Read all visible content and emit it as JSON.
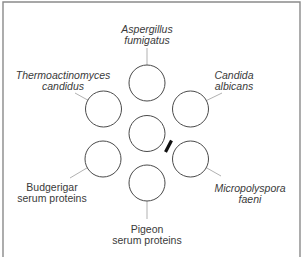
{
  "diagram": {
    "title": "",
    "type": "immunodiffusion well layout",
    "center_well": {
      "label": ""
    },
    "wells": [
      {
        "id": "top",
        "lines": [
          "Aspergillus",
          "fumigatus"
        ],
        "italic": true
      },
      {
        "id": "upper-left",
        "lines": [
          "Thermoactinomyces",
          "candidus"
        ],
        "italic": true
      },
      {
        "id": "upper-right",
        "lines": [
          "Candida",
          "albicans"
        ],
        "italic": true
      },
      {
        "id": "lower-left",
        "lines": [
          "Budgerigar",
          "serum proteins"
        ],
        "italic": false
      },
      {
        "id": "lower-right",
        "lines": [
          "Micropolyspora",
          "faeni"
        ],
        "italic": true
      },
      {
        "id": "bottom",
        "lines": [
          "Pigeon",
          "serum proteins"
        ],
        "italic": false
      }
    ],
    "precipitin_band": {
      "between": [
        "center",
        "lower-right"
      ],
      "color": "#111111"
    }
  },
  "colors": {
    "well_stroke": "#4a4a4a",
    "leader_line": "#a8a8a8",
    "label_text": "#3a3a3a",
    "frame": "#8a8a8a",
    "band": "#111111"
  }
}
